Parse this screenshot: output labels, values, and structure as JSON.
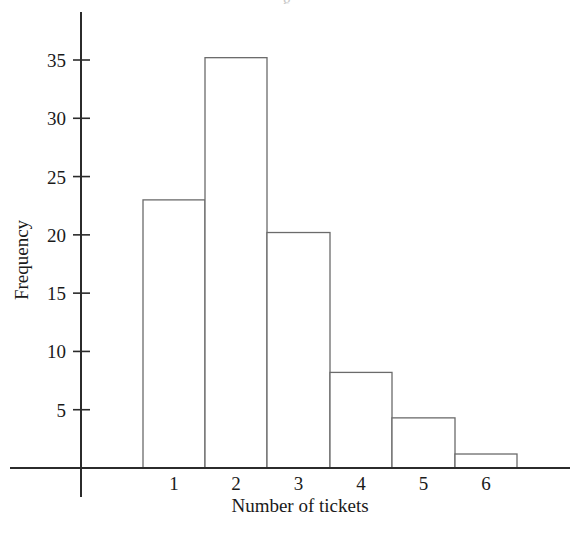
{
  "chart_data": {
    "type": "bar",
    "title": "",
    "xlabel": "Number of tickets",
    "ylabel": "Frequency",
    "categories": [
      "1",
      "2",
      "3",
      "4",
      "5",
      "6"
    ],
    "values": [
      23,
      35.2,
      20.2,
      8.2,
      4.3,
      1.2
    ],
    "ytick_labels": [
      "5",
      "10",
      "15",
      "20",
      "25",
      "30",
      "35"
    ],
    "ytick_values": [
      5,
      10,
      15,
      20,
      25,
      30,
      35
    ],
    "ylim": [
      0,
      39
    ],
    "xlim": [
      0.5,
      6.5
    ],
    "grid": false,
    "legend": false,
    "bar_fill": "#ffffff",
    "bar_stroke": "#6b6b6b",
    "axis_color": "#2b2b2b",
    "background": "#ffffff"
  },
  "partial_title_artifact": "g"
}
